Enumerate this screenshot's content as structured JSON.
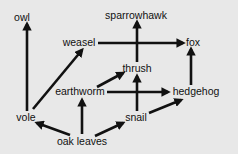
{
  "colors": {
    "background": "#e8e8e8",
    "ink": "#111111"
  },
  "nodes": [
    {
      "id": "owl",
      "label": "owl",
      "x": 22,
      "y": 21
    },
    {
      "id": "sparrowhawk",
      "label": "sparrowhawk",
      "x": 136,
      "y": 19
    },
    {
      "id": "weasel",
      "label": "weasel",
      "x": 79,
      "y": 46
    },
    {
      "id": "fox",
      "label": "fox",
      "x": 193,
      "y": 46
    },
    {
      "id": "thrush",
      "label": "thrush",
      "x": 137,
      "y": 72
    },
    {
      "id": "earthworm",
      "label": "earthworm",
      "x": 80,
      "y": 95
    },
    {
      "id": "hedgehog",
      "label": "hedgehog",
      "x": 196,
      "y": 95
    },
    {
      "id": "vole",
      "label": "vole",
      "x": 26,
      "y": 121
    },
    {
      "id": "snail",
      "label": "snail",
      "x": 136,
      "y": 121
    },
    {
      "id": "oak_leaves",
      "label": "oak leaves",
      "x": 82,
      "y": 145
    }
  ],
  "edges": [
    {
      "from": "vole",
      "to": "owl",
      "x1": 27,
      "y1": 111,
      "x2": 27,
      "y2": 24
    },
    {
      "from": "vole",
      "to": "weasel",
      "x1": 33,
      "y1": 109,
      "x2": 82,
      "y2": 50
    },
    {
      "from": "weasel",
      "to": "fox",
      "x1": 98,
      "y1": 43,
      "x2": 183,
      "y2": 43
    },
    {
      "from": "thrush",
      "to": "sparrowhawk",
      "x1": 137,
      "y1": 62,
      "x2": 137,
      "y2": 22
    },
    {
      "from": "earthworm",
      "to": "thrush",
      "x1": 97,
      "y1": 87,
      "x2": 123,
      "y2": 73
    },
    {
      "from": "earthworm",
      "to": "hedgehog",
      "x1": 107,
      "y1": 92,
      "x2": 168,
      "y2": 92
    },
    {
      "from": "snail",
      "to": "thrush",
      "x1": 137,
      "y1": 111,
      "x2": 137,
      "y2": 76
    },
    {
      "from": "snail",
      "to": "hedgehog",
      "x1": 149,
      "y1": 113,
      "x2": 181,
      "y2": 100
    },
    {
      "from": "hedgehog",
      "to": "fox",
      "x1": 191,
      "y1": 85,
      "x2": 191,
      "y2": 49
    },
    {
      "from": "oak_leaves",
      "to": "vole",
      "x1": 70,
      "y1": 135,
      "x2": 37,
      "y2": 123
    },
    {
      "from": "oak_leaves",
      "to": "earthworm",
      "x1": 82,
      "y1": 134,
      "x2": 82,
      "y2": 100
    },
    {
      "from": "oak_leaves",
      "to": "snail",
      "x1": 95,
      "y1": 136,
      "x2": 123,
      "y2": 123
    }
  ]
}
